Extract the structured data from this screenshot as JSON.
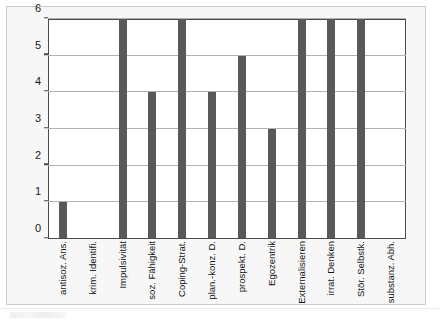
{
  "chart_data": {
    "type": "bar",
    "title": "",
    "subtitle": "",
    "xlabel": "",
    "ylabel": "",
    "ylim": [
      0,
      6
    ],
    "yticks": [
      0,
      1,
      2,
      3,
      4,
      5,
      6
    ],
    "ytick_labels": [
      "0",
      "1",
      "2",
      "3",
      "4",
      "5",
      "6"
    ],
    "grid": "horizontal",
    "legend": "none",
    "bar_color": "#595959",
    "plot_border_color": "#4a4a4a",
    "gridline_color": "#b2b2b2",
    "plot_background": "#ffffff",
    "page_background": "#f7f7f7",
    "categories": [
      "antisoz. Ans.",
      "krim. Identifi.",
      "Impulsivität",
      "soz. Fähigkeit",
      "Coping-Strat.",
      "plan.-konz. D.",
      "prospekt. D.",
      "Egozentrik",
      "Externalisieren",
      "irrat. Denken",
      "Stör. Selbstk.",
      "substanz. Abh."
    ],
    "values": [
      1,
      0,
      6,
      4,
      6,
      4,
      5,
      3,
      6,
      6,
      6,
      0
    ]
  }
}
